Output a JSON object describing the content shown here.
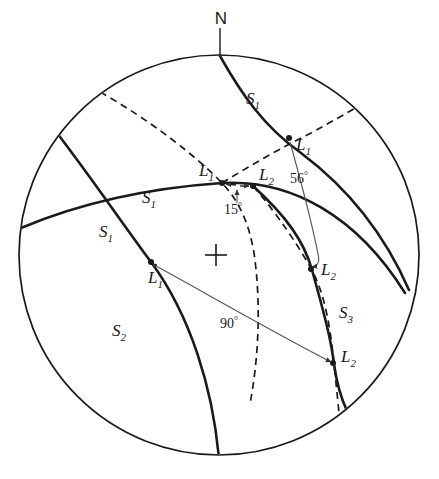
{
  "figure": {
    "kind": "stereographic-projection",
    "title": "",
    "background_color": "#ffffff",
    "ink_color": "#1a1a1a",
    "thin_ink_color": "#555555"
  },
  "primitive_circle": {
    "label": "primitive-circle",
    "center_x": 219,
    "center_y": 255,
    "radius": 200
  },
  "center_mark": {
    "symbol": "+",
    "x": 216,
    "y": 255
  },
  "compass": {
    "north_label": "N",
    "north_label_x": 221,
    "north_label_y": 22,
    "tick_x": 220,
    "tick_top_y": 28,
    "tick_bottom_y": 56
  },
  "plane_labels": [
    {
      "name": "s1-top",
      "text": "S",
      "sub": "1",
      "x": 246,
      "y": 104
    },
    {
      "name": "s1-middle-left",
      "text": "S",
      "sub": "1",
      "x": 142,
      "y": 203
    },
    {
      "name": "s1-lower-left",
      "text": "S",
      "sub": "1",
      "x": 99,
      "y": 237
    },
    {
      "name": "s2-lower-left",
      "text": "S",
      "sub": "2",
      "x": 112,
      "y": 336
    },
    {
      "name": "s3-right",
      "text": "S",
      "sub": "3",
      "x": 339,
      "y": 318
    }
  ],
  "lineation_labels": [
    {
      "name": "l1-upper-right",
      "text": "L",
      "sub": "1",
      "x": 296,
      "y": 150
    },
    {
      "name": "l1-center-top",
      "text": "L",
      "sub": "1",
      "x": 205,
      "y": 176
    },
    {
      "name": "l2-center-top",
      "text": "L",
      "sub": "2",
      "x": 259,
      "y": 180
    },
    {
      "name": "l1-lower-left",
      "text": "L",
      "sub": "1",
      "x": 152,
      "y": 281
    },
    {
      "name": "l2-mid-right",
      "text": "L",
      "sub": "2",
      "x": 323,
      "y": 274
    },
    {
      "name": "l2-bottom-right",
      "text": "L",
      "sub": "2",
      "x": 342,
      "y": 361
    }
  ],
  "lineation_points": [
    {
      "name": "point-l1-upper-right",
      "x": 289,
      "y": 138
    },
    {
      "name": "point-l1-center-top",
      "x": 222,
      "y": 183
    },
    {
      "name": "point-l2-center-top",
      "x": 253,
      "y": 186
    },
    {
      "name": "point-l1-lower-left",
      "x": 151,
      "y": 262
    },
    {
      "name": "point-l2-mid-right",
      "x": 311,
      "y": 269
    },
    {
      "name": "point-l2-bottom-right",
      "x": 333,
      "y": 363
    }
  ],
  "angle_annotations": [
    {
      "name": "angle-15",
      "value": "15",
      "unit": "°",
      "x": 233,
      "y": 208
    },
    {
      "name": "angle-56",
      "value": "56",
      "unit": "°",
      "x": 297,
      "y": 178
    },
    {
      "name": "angle-90",
      "value": "90",
      "unit": "°",
      "x": 228,
      "y": 323
    }
  ],
  "curves": {
    "solid_great_circles": [
      {
        "name": "s1-great-circle-ne",
        "path": "M 220,56 C 240,92 262,125 300,152 C 340,182 380,225 408,289"
      },
      {
        "name": "s1-great-circle-horizontal",
        "path": "M 21,228 C 80,203 150,188 222,183 C 290,179 356,215 404,292"
      },
      {
        "name": "s1-great-circle-sw",
        "path": "M 57,133 C 90,175 120,220 151,262 C 190,315 212,390 218,458"
      },
      {
        "name": "s3-great-circle-right",
        "path": "M 253,186 C 285,215 303,240 311,269 C 323,312 330,338 333,363 C 338,400 352,428 372,448"
      }
    ],
    "dashed_circles": [
      {
        "name": "s2-dashed-great-circle",
        "path": "M 100,92 C 150,120 195,155 222,183 C 238,200 248,222 253,252 C 260,300 258,355 249,403"
      },
      {
        "name": "s2-dashed-upper-right",
        "path": "M 222,183 C 250,165 280,148 310,133 C 330,122 344,114 356,107"
      },
      {
        "name": "s3-dashed-connector",
        "path": "M 253,186 C 278,215 296,243 311,269 C 325,296 330,332 333,363 C 336,392 338,410 339,425"
      }
    ],
    "angle_arcs": [
      {
        "name": "arc-56",
        "path": "M 290,141 C 299,175 310,215 318,255 C 324,262 329,266 311,266",
        "arrow_at": "end"
      },
      {
        "name": "arc-90",
        "path": "M 155,265 C 200,290 260,325 330,362",
        "arrow_at": "both"
      },
      {
        "name": "arc-15",
        "path": "M 237,201 L 237,190",
        "arrow_at": "end"
      }
    ]
  }
}
